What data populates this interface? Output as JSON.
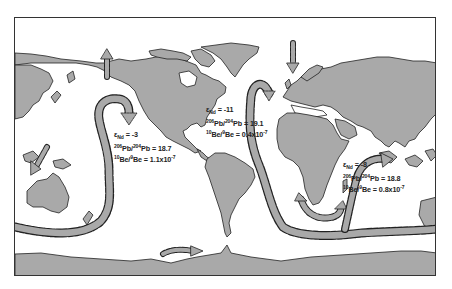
{
  "figure": {
    "type": "world map of ocean circulation with isotope signatures",
    "colors": {
      "land": "#a9a9a9",
      "ocean": "#ffffff",
      "flow_band": "#a9a9a9",
      "flow_outline": "#222222",
      "frame": "#333333"
    }
  },
  "labels": [
    {
      "id": "pacific",
      "eps_symbol": "ε",
      "eps_sub": "Nd",
      "eps_value": " = -3",
      "pb_mass1": "206",
      "pb_el1": "Pb/",
      "pb_mass2": "204",
      "pb_el2": "Pb",
      "pb_value": " = 18.7",
      "be_mass1": "10",
      "be_el1": "Be/",
      "be_mass2": "9",
      "be_el2": "Be",
      "be_value": " = 1.1x10",
      "be_exp": "-7"
    },
    {
      "id": "atlantic",
      "eps_symbol": "ε",
      "eps_sub": "Nd",
      "eps_value": " = -11",
      "pb_mass1": "206",
      "pb_el1": "Pb/",
      "pb_mass2": "204",
      "pb_el2": "Pb",
      "pb_value": " = 19.1",
      "be_mass1": "10",
      "be_el1": "Be/",
      "be_mass2": "9",
      "be_el2": "Be",
      "be_value": " = 0.4x10",
      "be_exp": "-7"
    },
    {
      "id": "indian",
      "eps_symbol": "ε",
      "eps_sub": "Nd",
      "eps_value": " = -8",
      "pb_mass1": "206",
      "pb_el1": "Pb/",
      "pb_mass2": "204",
      "pb_el2": "Pb",
      "pb_value": " = 18.8",
      "be_mass1": "10",
      "be_el1": "Be/",
      "be_mass2": "9",
      "be_el2": "Be",
      "be_value": " = 0.8x10",
      "be_exp": "-7"
    }
  ]
}
